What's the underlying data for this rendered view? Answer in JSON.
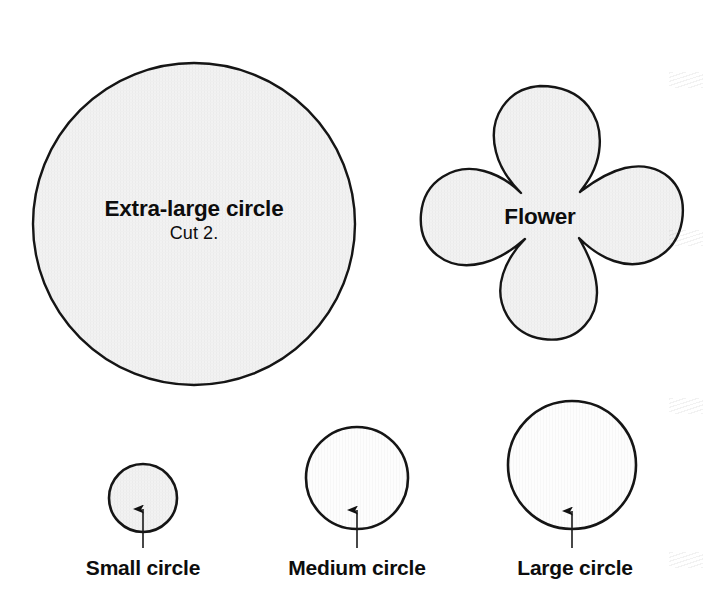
{
  "sheet": {
    "title": "Pattern template sheet",
    "background_color": "#ffffff",
    "outline_color": "#111111",
    "shaded_fill_color": "#f1f1f1",
    "plain_fill_color": "#fefefe",
    "text_color": "#0d0d0d",
    "width": 705,
    "height": 611
  },
  "shapes": {
    "extra_large_circle": {
      "name": "Extra-large circle",
      "label": "Extra-large circle",
      "instruction": "Cut 2.",
      "kind": "circle",
      "center_x": 194,
      "center_y": 224,
      "radius": 162,
      "filled": true
    },
    "flower": {
      "name": "Flower",
      "label": "Flower",
      "instruction": "",
      "kind": "flower",
      "petal_count": 6,
      "center_x": 540,
      "center_y": 222,
      "radius": 140,
      "filled": true
    },
    "small_circle": {
      "name": "Small circle",
      "label": "Small circle",
      "kind": "circle",
      "center_x": 143,
      "center_y": 498,
      "radius": 35,
      "filled": true,
      "arrow": {
        "tip_x": 143,
        "tip_y": 508,
        "tail_x": 143,
        "tail_y": 548
      }
    },
    "medium_circle": {
      "name": "Medium circle",
      "label": "Medium circle",
      "kind": "circle",
      "center_x": 357,
      "center_y": 478,
      "radius": 52,
      "filled": false,
      "arrow": {
        "tip_x": 357,
        "tip_y": 508,
        "tail_x": 357,
        "tail_y": 548
      }
    },
    "large_circle": {
      "name": "Large circle",
      "label": "Large circle",
      "kind": "circle",
      "center_x": 572,
      "center_y": 465,
      "radius": 65,
      "filled": false,
      "arrow": {
        "tip_x": 572,
        "tip_y": 508,
        "tail_x": 572,
        "tail_y": 548
      }
    }
  }
}
